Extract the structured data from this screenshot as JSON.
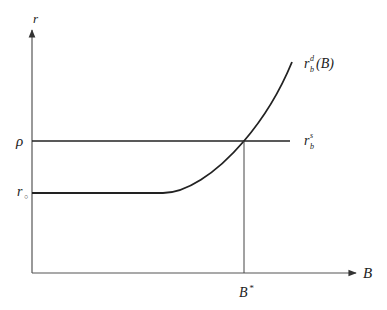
{
  "diagram": {
    "type": "economic-equilibrium",
    "axes": {
      "y_label": "r",
      "x_label": "B"
    },
    "tick_labels": {
      "rho": "ρ",
      "r0_main": "r",
      "r0_sub": "○",
      "b_star_main": "B",
      "b_star_sup": "*"
    },
    "curves": [
      {
        "name": "demand",
        "label_main": "r",
        "label_sup": "d",
        "label_sub": "b",
        "label_tail": "(B)",
        "shape": "flat at r0 then convex increasing"
      },
      {
        "name": "supply",
        "label_main": "r",
        "label_sup": "s",
        "label_sub": "b",
        "shape": "horizontal at ρ"
      }
    ],
    "equilibrium": {
      "x": "B*",
      "y": "ρ"
    },
    "colors": {
      "line": "#222222",
      "axis": "#555555",
      "background": "#ffffff"
    }
  }
}
